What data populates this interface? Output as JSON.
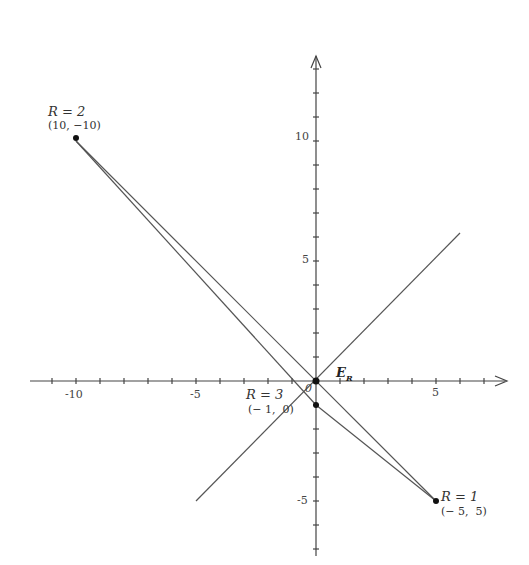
{
  "axes": {
    "origin_px": [
      316,
      381
    ],
    "px_per_unit": 24,
    "x_ticks": [
      {
        "label": "-10",
        "value": -10
      },
      {
        "label": "-5",
        "value": -5
      },
      {
        "label": "5",
        "value": 5
      }
    ],
    "y_ticks": [
      {
        "label": "10",
        "value": 10
      },
      {
        "label": "5",
        "value": 5
      },
      {
        "label": "-5",
        "value": -5
      }
    ],
    "origin_label": "0",
    "x_range": [
      -12,
      7.5
    ],
    "y_range": [
      -7,
      13.5
    ]
  },
  "points": [
    {
      "name": "R = 2",
      "coord_label": "(10, −10)",
      "x": -10,
      "y": 10
    },
    {
      "name": "R = 1",
      "coord_label": "(− 5,  5)",
      "x": 5,
      "y": -5
    },
    {
      "name": "R = 3",
      "coord_label": "(− 1,  0)",
      "x": 0,
      "y": -1
    }
  ],
  "special_point": {
    "label": "E",
    "subscript": "R",
    "x": 0,
    "y": 0
  },
  "lines": [
    {
      "from": [
        -10,
        10
      ],
      "to": [
        5,
        -5
      ],
      "desc": "R2 to R1 through origin"
    },
    {
      "from": [
        -10,
        10
      ],
      "to": [
        0,
        -1
      ],
      "desc": "R2 to R3"
    },
    {
      "from": [
        0,
        -1
      ],
      "to": [
        5,
        -5
      ],
      "desc": "R3 to R1"
    },
    {
      "from": [
        -5,
        -5
      ],
      "to": [
        6,
        6
      ],
      "desc": "diagonal y = x"
    }
  ],
  "labels": {
    "r2_name": "R = 2",
    "r2_coord": "(10, −10)",
    "r1_name": "R = 1",
    "r1_coord": "(− 5,  5)",
    "r3_name": "R = 3",
    "r3_coord": "(− 1,  0)",
    "er_main": "E",
    "er_sub": "R",
    "origin": "0",
    "x_tick_m10": "-10",
    "x_tick_m5": "-5",
    "x_tick_5": "5",
    "y_tick_10": "10",
    "y_tick_5": "5",
    "y_tick_m5": "-5"
  }
}
